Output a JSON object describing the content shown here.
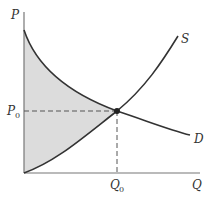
{
  "diagram": {
    "type": "supply-demand",
    "axes": {
      "y_label": "P",
      "x_label": "Q"
    },
    "equilibrium": {
      "price_label": "P",
      "price_sub": "0",
      "quantity_label": "Q",
      "quantity_sub": "0"
    },
    "curves": {
      "supply_label": "S",
      "demand_label": "D"
    },
    "shaded_region": "area between demand and supply curves left of equilibrium (total surplus)",
    "colors": {
      "line": "#333333",
      "shade": "#dcdcdc",
      "axis": "#777777"
    }
  }
}
